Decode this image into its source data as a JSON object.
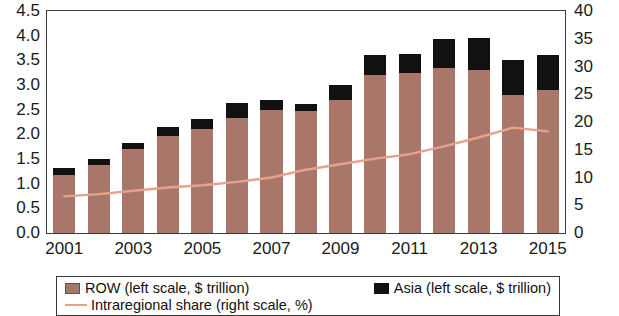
{
  "chart_data": {
    "type": "bar",
    "title": "",
    "xlabel": "",
    "ylabel": "",
    "categories": [
      "2001",
      "2002",
      "2003",
      "2004",
      "2005",
      "2006",
      "2007",
      "2008",
      "2009",
      "2010",
      "2011",
      "2012",
      "2013",
      "2014",
      "2015"
    ],
    "x_tick_labels": [
      "2001",
      "2003",
      "2005",
      "2007",
      "2009",
      "2011",
      "2013",
      "2015"
    ],
    "left_axis": {
      "label": "$ trillion",
      "ylim": [
        0.0,
        4.5
      ],
      "ticks": [
        "0.0",
        "0.5",
        "1.0",
        "1.5",
        "2.0",
        "2.5",
        "3.0",
        "3.5",
        "4.0",
        "4.5"
      ]
    },
    "right_axis": {
      "label": "%",
      "ylim": [
        0,
        40
      ],
      "ticks": [
        "0",
        "5",
        "10",
        "15",
        "20",
        "25",
        "30",
        "35",
        "40"
      ]
    },
    "grid": false,
    "legend_position": "bottom",
    "series": [
      {
        "name": "ROW (left scale, $ trillion)",
        "type": "bar",
        "axis": "left",
        "color": "#a9766a",
        "values": [
          1.18,
          1.38,
          1.7,
          1.97,
          2.1,
          2.33,
          2.5,
          2.48,
          2.7,
          3.2,
          3.25,
          3.35,
          3.3,
          2.8,
          2.9
        ]
      },
      {
        "name": "Asia (left scale, $ trillion)",
        "type": "bar",
        "axis": "left",
        "color": "#111111",
        "values": [
          0.13,
          0.12,
          0.13,
          0.18,
          0.22,
          0.3,
          0.2,
          0.13,
          0.3,
          0.4,
          0.38,
          0.58,
          0.65,
          0.7,
          0.7
        ]
      },
      {
        "name": "Intraregional share  (right scale, %)",
        "type": "line",
        "axis": "right",
        "color": "#e8a18c",
        "values": [
          6.6,
          7.0,
          7.6,
          8.2,
          8.6,
          9.2,
          10.0,
          11.4,
          12.4,
          13.4,
          14.2,
          15.6,
          17.2,
          19.0,
          18.3
        ]
      }
    ]
  },
  "legend": {
    "row_label": "ROW (left scale, $ trillion)",
    "asia_label": "Asia (left scale, $ trillion)",
    "line_label": "Intraregional share  (right scale, %)"
  }
}
